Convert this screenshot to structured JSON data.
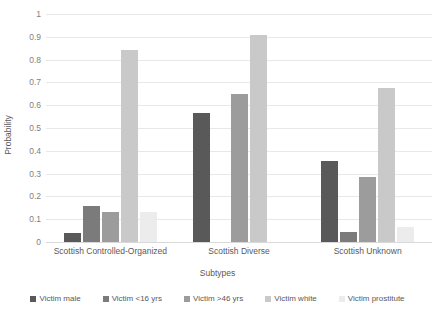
{
  "chart_data": {
    "type": "bar",
    "title": "",
    "subtitle": "",
    "xlabel": "Subtypes",
    "ylabel": "Probability",
    "ylim": [
      0,
      1
    ],
    "yticks": [
      "0",
      "0.1",
      "0.2",
      "0.3",
      "0.4",
      "0.5",
      "0.6",
      "0.7",
      "0.8",
      "0.9",
      "1"
    ],
    "ytick_values": [
      0,
      0.1,
      0.2,
      0.3,
      0.4,
      0.5,
      0.6,
      0.7,
      0.8,
      0.9,
      1
    ],
    "grid": true,
    "legend_position": "bottom",
    "categories": [
      "Scottish Controlled-Organized",
      "Scottish Diverse",
      "Scottish Unknown"
    ],
    "series": [
      {
        "name": "Victim male",
        "color": "#595959",
        "values": [
          0.04,
          0.565,
          0.355
        ]
      },
      {
        "name": "Victim <16 yrs",
        "color": "#7b7b7b",
        "values": [
          0.16,
          0,
          0.045
        ]
      },
      {
        "name": "Victim >46 yrs",
        "color": "#9c9c9c",
        "values": [
          0.13,
          0.65,
          0.285
        ]
      },
      {
        "name": "Victim white",
        "color": "#c9c9c9",
        "values": [
          0.84,
          0.91,
          0.675
        ]
      },
      {
        "name": "Victim prostitute",
        "color": "#ececec",
        "values": [
          0.13,
          0,
          0.065
        ]
      }
    ]
  }
}
